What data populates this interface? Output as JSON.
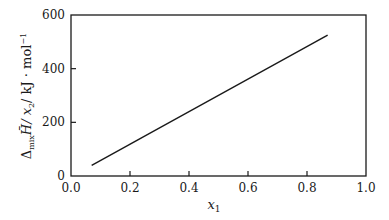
{
  "chart_data": {
    "type": "line",
    "title": "",
    "xlabel": "x1",
    "ylabel": "Δmix H̄ / x2 / kJ·mol⁻¹",
    "xlim": [
      0.0,
      1.0
    ],
    "ylim": [
      0,
      600
    ],
    "xticks": [
      "0.0",
      "0.2",
      "0.4",
      "0.6",
      "0.8",
      "1.0"
    ],
    "yticks": [
      "0",
      "200",
      "400",
      "600"
    ],
    "grid": false,
    "legend": null,
    "series": [
      {
        "name": "ΔmixH/x2",
        "x": [
          0.07,
          0.87
        ],
        "y": [
          40,
          525
        ]
      }
    ]
  },
  "labels": {
    "xlabel_main": "x",
    "xlabel_sub": "1",
    "ylabel_delta": "Δ",
    "ylabel_mix": "mix",
    "ylabel_H": "H̄",
    "ylabel_x": "/ x",
    "ylabel_x_sub": "2",
    "ylabel_unit": "/ kJ · mol",
    "ylabel_exp": "−1"
  },
  "colors": {
    "line": "#1a1a1a",
    "axis": "#1a1a1a",
    "background": "#ffffff"
  }
}
